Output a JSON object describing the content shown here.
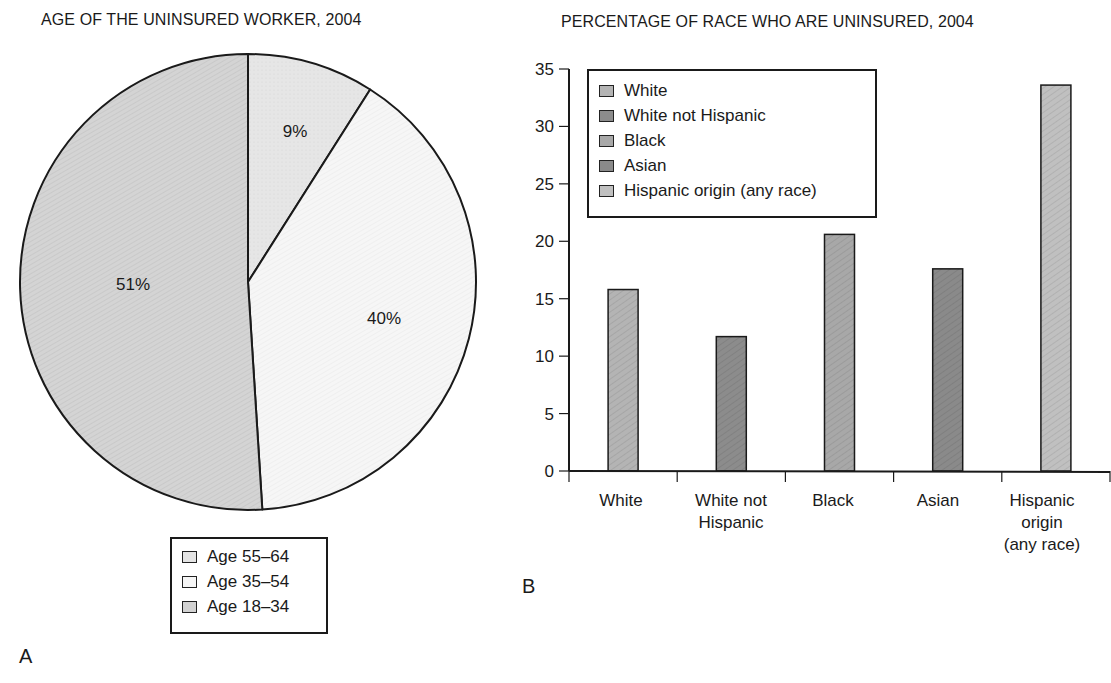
{
  "panel_a": {
    "title": "AGE OF THE UNINSURED WORKER, 2004",
    "panel_letter": "A",
    "legend": [
      {
        "label": "Age 55–64",
        "color": "#e4e4e4"
      },
      {
        "label": "Age 35–54",
        "color": "#f6f6f6"
      },
      {
        "label": "Age 18–34",
        "color": "#d2d2d2"
      }
    ],
    "slice_labels": [
      "9%",
      "40%",
      "51%"
    ]
  },
  "panel_b": {
    "title": "PERCENTAGE OF RACE WHO ARE UNINSURED, 2004",
    "panel_letter": "B",
    "legend": [
      {
        "label": "White",
        "color": "#b4b4b4"
      },
      {
        "label": "White not Hispanic",
        "color": "#8c8c8c"
      },
      {
        "label": "Black",
        "color": "#a8a8a8"
      },
      {
        "label": "Asian",
        "color": "#8a8a8a"
      },
      {
        "label": "Hispanic origin (any race)",
        "color": "#c0c0c0"
      }
    ],
    "y_ticks": [
      "0",
      "5",
      "10",
      "15",
      "20",
      "25",
      "30",
      "35"
    ],
    "x_labels": [
      "White",
      "White not\nHispanic",
      "Black",
      "Asian",
      "Hispanic\norigin\n(any race)"
    ]
  },
  "chart_data": [
    {
      "type": "pie",
      "title": "AGE OF THE UNINSURED WORKER, 2004",
      "categories": [
        "Age 55–64",
        "Age 35–54",
        "Age 18–34"
      ],
      "values": [
        9,
        40,
        51
      ],
      "unit": "%",
      "colors": [
        "#e4e4e4",
        "#f6f6f6",
        "#d2d2d2"
      ],
      "start_angle": "12 o'clock, clockwise",
      "legend_position": "below"
    },
    {
      "type": "bar",
      "title": "PERCENTAGE OF RACE WHO ARE UNINSURED, 2004",
      "categories": [
        "White",
        "White not Hispanic",
        "Black",
        "Asian",
        "Hispanic origin (any race)"
      ],
      "values": [
        15.8,
        11.7,
        20.6,
        17.6,
        33.6
      ],
      "colors": [
        "#b4b4b4",
        "#8c8c8c",
        "#a8a8a8",
        "#8a8a8a",
        "#c0c0c0"
      ],
      "xlabel": "",
      "ylabel": "",
      "ylim": [
        0,
        35
      ],
      "yticks": [
        0,
        5,
        10,
        15,
        20,
        25,
        30,
        35
      ],
      "grid": false,
      "legend_position": "upper left inside"
    }
  ]
}
